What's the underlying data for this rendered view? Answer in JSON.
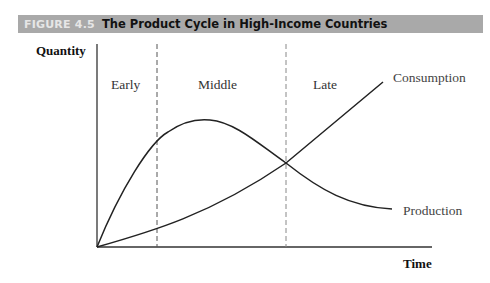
{
  "figure": {
    "number": "FIGURE 4.5",
    "title": "The Product Cycle in High-Income Countries"
  },
  "axes": {
    "ylabel": "Quantity",
    "xlabel": "Time"
  },
  "phases": [
    {
      "label": "Early"
    },
    {
      "label": "Middle"
    },
    {
      "label": "Late"
    }
  ],
  "curves": [
    {
      "name": "Consumption",
      "label": "Consumption",
      "color": "#222222"
    },
    {
      "name": "Production",
      "label": "Production",
      "color": "#222222"
    }
  ],
  "colors": {
    "header_bg": "#a9a9a9",
    "header_number": "#e6e6e6",
    "header_title": "#111111",
    "axis": "#333333",
    "divider": "#555555"
  }
}
